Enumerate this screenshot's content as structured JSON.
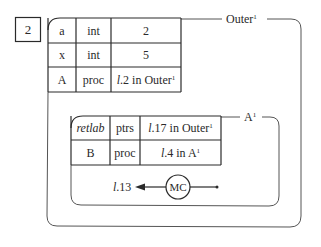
{
  "diagram": {
    "frame_number": "2",
    "outer": {
      "title": "Outer",
      "title_superscript": "1",
      "rows": [
        {
          "name": "a",
          "type": "int",
          "value": "2",
          "value_italic_prefix": ""
        },
        {
          "name": "x",
          "type": "int",
          "value": "5",
          "value_italic_prefix": ""
        },
        {
          "name": "A",
          "type": "proc",
          "value_italic_prefix": "l",
          "value": ".2 in Outer",
          "value_superscript": "1"
        }
      ]
    },
    "inner": {
      "title": "A",
      "title_superscript": "1",
      "rows": [
        {
          "name": "retlab",
          "name_italic": true,
          "type": "ptrs",
          "value_italic_prefix": "l",
          "value": ".17 in Outer",
          "value_superscript": "1"
        },
        {
          "name": "B",
          "type": "proc",
          "value_italic_prefix": "l",
          "value": ".4 in A",
          "value_superscript": "1"
        }
      ],
      "control": {
        "label_italic_prefix": "l",
        "label": ".13",
        "node": "MC"
      }
    },
    "colors": {
      "line": "#2a2a2a",
      "frame_line": "#555555",
      "background": "#ffffff"
    }
  }
}
